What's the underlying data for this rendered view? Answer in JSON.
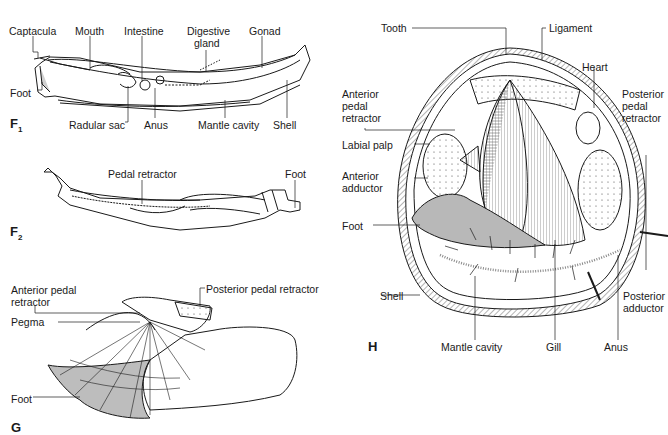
{
  "figures": {
    "F1": {
      "letter": "F",
      "subscript": "1",
      "labels": {
        "captacula": "Captacula",
        "mouth": "Mouth",
        "intestine": "Intestine",
        "digestive_gland_1": "Digestive",
        "digestive_gland_2": "gland",
        "gonad": "Gonad",
        "foot": "Foot",
        "radular_sac": "Radular sac",
        "anus": "Anus",
        "mantle_cavity": "Mantle cavity",
        "shell": "Shell"
      }
    },
    "F2": {
      "letter": "F",
      "subscript": "2",
      "labels": {
        "pedal_retractor": "Pedal retractor",
        "foot": "Foot"
      }
    },
    "G": {
      "letter": "G",
      "labels": {
        "anterior_pedal_retractor_1": "Anterior pedal",
        "anterior_pedal_retractor_2": "retractor",
        "posterior_pedal_retractor": "Posterior pedal retractor",
        "pegma": "Pegma",
        "foot": "Foot"
      }
    },
    "H": {
      "letter": "H",
      "labels": {
        "tooth": "Tooth",
        "ligament": "Ligament",
        "heart": "Heart",
        "anterior_pedal_retractor_1": "Anterior",
        "anterior_pedal_retractor_2": "pedal",
        "anterior_pedal_retractor_3": "retractor",
        "posterior_pedal_retractor_1": "Posterior",
        "posterior_pedal_retractor_2": "pedal",
        "posterior_pedal_retractor_3": "retractor",
        "labial_palp": "Labial palp",
        "anterior_adductor_1": "Anterior",
        "anterior_adductor_2": "adductor",
        "foot": "Foot",
        "shell": "Shell",
        "posterior_adductor_1": "Posterior",
        "posterior_adductor_2": "adductor",
        "mantle_cavity": "Mantle cavity",
        "gill": "Gill",
        "anus": "Anus"
      }
    }
  },
  "colors": {
    "ink": "#1a1a1a",
    "shade": "#b8b8b8",
    "paper": "#ffffff"
  }
}
